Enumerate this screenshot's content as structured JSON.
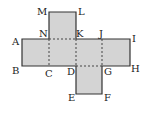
{
  "diagram": {
    "type": "cube-net",
    "fill_color": "#d4d4d4",
    "stroke_color": "#333333",
    "points": {
      "A": {
        "label": "A"
      },
      "B": {
        "label": "B"
      },
      "C": {
        "label": "C"
      },
      "D": {
        "label": "D"
      },
      "E": {
        "label": "E"
      },
      "F": {
        "label": "F"
      },
      "G": {
        "label": "G"
      },
      "H": {
        "label": "H"
      },
      "I": {
        "label": "I"
      },
      "J": {
        "label": "J"
      },
      "K": {
        "label": "K"
      },
      "L": {
        "label": "L"
      },
      "M": {
        "label": "M"
      },
      "N": {
        "label": "N"
      }
    },
    "faces": [
      {
        "name": "top-face",
        "vertices": [
          "M",
          "L",
          "K",
          "N"
        ]
      },
      {
        "name": "left-face",
        "vertices": [
          "A",
          "N",
          "C",
          "B"
        ]
      },
      {
        "name": "center-face",
        "vertices": [
          "N",
          "K",
          "D",
          "C"
        ]
      },
      {
        "name": "center-right-face",
        "vertices": [
          "K",
          "J",
          "G",
          "D"
        ]
      },
      {
        "name": "right-face",
        "vertices": [
          "J",
          "I",
          "H",
          "G"
        ]
      },
      {
        "name": "bottom-face",
        "vertices": [
          "D",
          "G",
          "F",
          "E"
        ]
      }
    ],
    "fold_lines_dashed": [
      "N-C",
      "K-D",
      "J-G",
      "N-K",
      "K-J",
      "D-G"
    ]
  }
}
